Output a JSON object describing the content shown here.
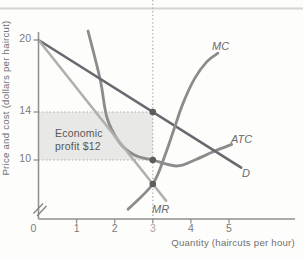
{
  "figure": {
    "y_axis_label": "Price and cost (dollars per haircut)",
    "x_axis_label": "Quantity (haircuts per hour)",
    "annotation": {
      "line1": "Economic",
      "line2": "profit $12",
      "full": "Economic profit $12"
    },
    "curve_labels": {
      "mc": "MC",
      "atc": "ATC",
      "d": "D",
      "mr": "MR"
    }
  },
  "colors": {
    "demand": "#686870",
    "marginal_revenue": "#b4aeae",
    "marginal_cost": "#8c8c8c",
    "average_total_cost": "#8c8c8c",
    "profit_fill": "#e8e8e6",
    "dots": "#5c5c5c",
    "axis": "#8f8f8f",
    "guide_dotted": "#a2a2a2",
    "top_rule": "#d4d4d2"
  },
  "chart_data": {
    "type": "line",
    "xlabel": "Quantity (haircuts per hour)",
    "ylabel": "Price and cost (dollars per haircut)",
    "xlim": [
      0,
      6.7
    ],
    "ylim_shown": [
      5.5,
      20
    ],
    "axis_break_y": true,
    "grid": false,
    "x_ticks": [
      {
        "v": 0,
        "label": "0"
      },
      {
        "v": 1,
        "label": "1"
      },
      {
        "v": 2,
        "label": "2"
      },
      {
        "v": 3,
        "label": "3"
      },
      {
        "v": 4,
        "label": "4"
      },
      {
        "v": 5,
        "label": "5"
      }
    ],
    "y_ticks": [
      {
        "v": 20,
        "label": "20"
      },
      {
        "v": 14,
        "label": "14"
      },
      {
        "v": 10,
        "label": "10"
      }
    ],
    "series": [
      {
        "name": "average_total_cost",
        "label": "ATC",
        "kind": "smooth",
        "color": "#8c8c8c",
        "width": 2.8,
        "points": [
          [
            1.3,
            20.75
          ],
          [
            1.62,
            16.7
          ],
          [
            1.8,
            13.5
          ],
          [
            2.14,
            11.4
          ],
          [
            2.53,
            10.4
          ],
          [
            3.0,
            10.0
          ],
          [
            3.63,
            9.5
          ],
          [
            4.1,
            10.0
          ],
          [
            4.63,
            10.75
          ],
          [
            5.07,
            11.3
          ]
        ]
      },
      {
        "name": "demand",
        "label": "D",
        "kind": "straight",
        "color": "#686870",
        "width": 2.6,
        "points": [
          [
            0,
            20
          ],
          [
            5.32,
            9.36
          ]
        ]
      },
      {
        "name": "marginal_revenue",
        "label": "MR",
        "kind": "straight",
        "color": "#b4aeae",
        "width": 2.6,
        "points": [
          [
            0,
            20
          ],
          [
            3.35,
            6.6
          ]
        ]
      },
      {
        "name": "marginal_cost",
        "label": "MC",
        "kind": "smooth",
        "color": "#8c8c8c",
        "width": 2.8,
        "points": [
          [
            2.35,
            5.9
          ],
          [
            3.0,
            8.0
          ],
          [
            3.32,
            10.4
          ],
          [
            3.55,
            12.5
          ],
          [
            3.79,
            14.7
          ],
          [
            4.1,
            16.8
          ],
          [
            4.42,
            18.2
          ],
          [
            4.71,
            18.9
          ]
        ]
      }
    ],
    "markers": {
      "color": "#5c5c5c",
      "radius": 3.3,
      "points": [
        [
          3,
          14
        ],
        [
          3,
          10
        ],
        [
          3,
          8
        ]
      ]
    },
    "guides": {
      "vertical_at_q": 3,
      "horizontal_at_p": [
        14,
        10
      ],
      "color": "#a2a2a2"
    },
    "profit_region": {
      "q_from": 0,
      "q_to": 3,
      "p_from": 10,
      "p_to": 14,
      "fill": "#e8e8e6",
      "label": "Economic profit $12",
      "profit_value": "$12",
      "price": 14,
      "atc_at_q": 10
    }
  }
}
